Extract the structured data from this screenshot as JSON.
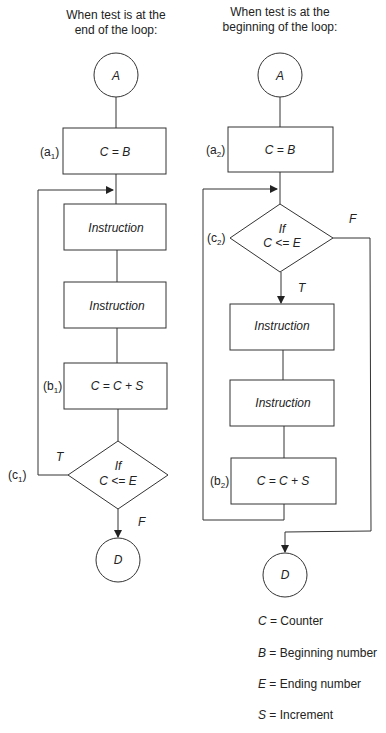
{
  "figure": {
    "left": {
      "title_line1": "When test is at the",
      "title_line2": "end of the loop:",
      "start": "A",
      "init": {
        "tag": "a",
        "sub": "1",
        "text": "C = B"
      },
      "instr1": "Instruction",
      "instr2": "Instruction",
      "incr": {
        "tag": "b",
        "sub": "1",
        "text": "C = C + S"
      },
      "decision": {
        "tag": "c",
        "sub": "1",
        "line1": "If",
        "line2": "C <= E",
        "true_label": "T",
        "false_label": "F"
      },
      "end": "D"
    },
    "right": {
      "title_line1": "When test is at the",
      "title_line2": "beginning of the loop:",
      "start": "A",
      "init": {
        "tag": "a",
        "sub": "2",
        "text": "C = B"
      },
      "decision": {
        "tag": "c",
        "sub": "2",
        "line1": "If",
        "line2": "C <= E",
        "true_label": "T",
        "false_label": "F"
      },
      "instr1": "Instruction",
      "instr2": "Instruction",
      "incr": {
        "tag": "b",
        "sub": "2",
        "text": "C = C + S"
      },
      "end": "D"
    },
    "legend": [
      {
        "var": "C",
        "eq": " = ",
        "desc": "Counter"
      },
      {
        "var": "B",
        "eq": " = ",
        "desc": "Beginning number"
      },
      {
        "var": "E",
        "eq": " = ",
        "desc": "Ending number"
      },
      {
        "var": "S",
        "eq": " = ",
        "desc": "Increment"
      }
    ]
  }
}
